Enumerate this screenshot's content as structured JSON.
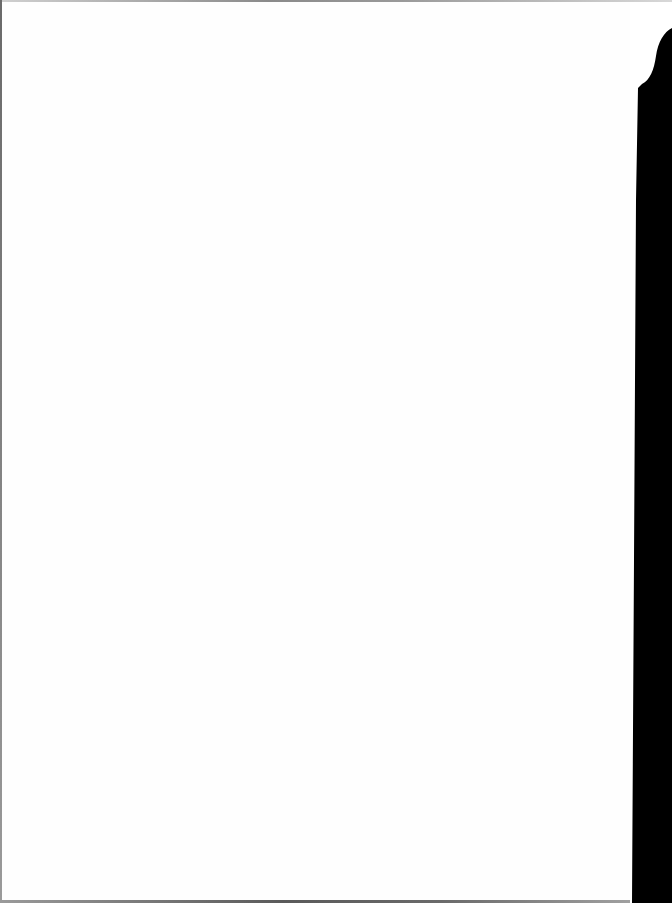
{
  "page": {
    "background_color": "#ffffff",
    "edge_color": "#000000",
    "content": []
  }
}
